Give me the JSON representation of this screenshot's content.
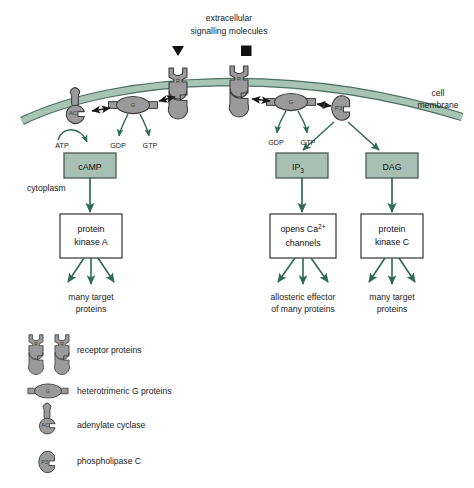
{
  "figure": {
    "title_lines": [
      "extracellular",
      "signalling molecules"
    ],
    "membrane_label_lines": [
      "cell",
      "membrane"
    ],
    "cytoplasm_label": "cytoplasm"
  },
  "colors": {
    "membrane_fill": "#a8c4b4",
    "membrane_stroke": "#4a7060",
    "protein_fill": "#9a9a9a",
    "protein_stroke": "#3d3d3d",
    "box_fill": "#a8c0b4",
    "box_stroke": "#4a5d55",
    "box_white": "#ffffff",
    "arrow_green": "#2d6b52",
    "arrow_black": "#1a1a1a",
    "text": "#1a1a1a"
  },
  "membrane_proteins": [
    {
      "id": "adenylate-cyclase-left",
      "label": "AC",
      "type": "adenylate-cyclase"
    },
    {
      "id": "g-protein-left",
      "label": "G",
      "type": "g-protein"
    },
    {
      "id": "receptor-left",
      "label": "R",
      "type": "receptor"
    },
    {
      "id": "receptor-right",
      "label": "R",
      "type": "receptor"
    },
    {
      "id": "g-protein-right",
      "label": "G",
      "type": "g-protein"
    },
    {
      "id": "phospholipase-c",
      "label": "P3",
      "type": "phospholipase-c"
    }
  ],
  "ligands": [
    {
      "id": "ligand-triangle",
      "shape": "triangle"
    },
    {
      "id": "ligand-square",
      "shape": "square"
    }
  ],
  "substrate_labels": [
    {
      "id": "atp-label",
      "text": "ATP"
    },
    {
      "id": "gdp-label-left",
      "text": "GDP"
    },
    {
      "id": "gtp-label-left",
      "text": "GTP"
    },
    {
      "id": "gdp-label-right",
      "text": "GDP"
    },
    {
      "id": "gtp-label-right",
      "text": "GTP"
    }
  ],
  "pathways": [
    {
      "id": "camp-pathway",
      "messenger": {
        "label": "cAMP",
        "style": "filled"
      },
      "effector": {
        "lines": [
          "protein",
          "kinase A"
        ],
        "style": "white"
      },
      "outcome": {
        "lines": [
          "many target",
          "proteins"
        ]
      }
    },
    {
      "id": "ip3-pathway",
      "messenger": {
        "label": "IP3",
        "label_base": "IP",
        "label_sub": "3",
        "style": "filled"
      },
      "effector": {
        "lines": [
          "opens Ca2+",
          "channels"
        ],
        "line1_base": "opens Ca",
        "line1_sup": "2+",
        "style": "white"
      },
      "outcome": {
        "lines": [
          "allosteric effector",
          "of many proteins"
        ]
      }
    },
    {
      "id": "dag-pathway",
      "messenger": {
        "label": "DAG",
        "style": "filled"
      },
      "effector": {
        "lines": [
          "protein",
          "kinase C"
        ],
        "style": "white"
      },
      "outcome": {
        "lines": [
          "many target",
          "proteins"
        ]
      }
    }
  ],
  "legend": {
    "items": [
      {
        "id": "legend-receptor-proteins",
        "icon": "receptor-pair-icon",
        "glyph": "R",
        "label": "receptor proteins"
      },
      {
        "id": "legend-g-proteins",
        "icon": "g-protein-icon",
        "glyph": "G",
        "label": "heterotrimeric G proteins"
      },
      {
        "id": "legend-adenylate-cyclase",
        "icon": "adenylate-cyclase-icon",
        "glyph": "AC",
        "label": "adenylate cyclase"
      },
      {
        "id": "legend-phospholipase-c",
        "icon": "phospholipase-c-icon",
        "glyph": "P3",
        "label": "phospholipase C"
      }
    ]
  }
}
